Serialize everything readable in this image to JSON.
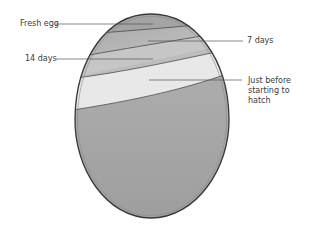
{
  "diagram": {
    "labels": [
      {
        "id": "fresh",
        "text": "Fresh egg"
      },
      {
        "id": "day7",
        "text": "7 days"
      },
      {
        "id": "day14",
        "text": "14 days"
      },
      {
        "id": "hatch",
        "text": "Just before starting to hatch"
      }
    ],
    "footer_bleed_text": "Air cell growth during incubation"
  },
  "colors": {
    "egg_fill": "#a9a9a9",
    "egg_outline": "#3a3a3a",
    "band_light": "#e6e6e6",
    "band_mid": "#c4c4c4",
    "band_dark": "#b0b0b0",
    "leader_line": "#555555",
    "text": "#3a3a3a"
  }
}
